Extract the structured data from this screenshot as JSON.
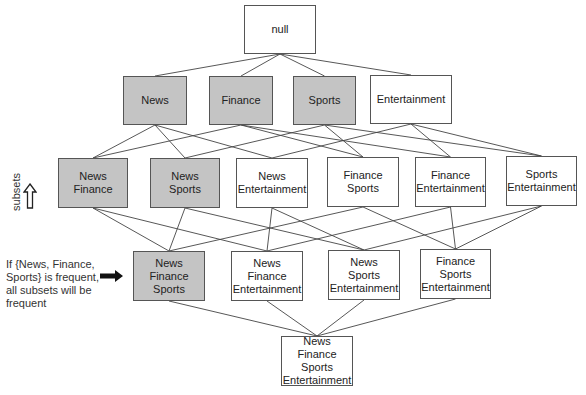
{
  "diagram": {
    "type": "itemset-lattice",
    "colors": {
      "frequent_fill": "#c4c4c4",
      "infrequent_fill": "#ffffff",
      "border": "#555555",
      "edge": "#444444"
    },
    "nodes": [
      {
        "id": "null",
        "lines": [
          "null"
        ],
        "frequent": false,
        "x": 244,
        "y": 5,
        "w": 72,
        "h": 49
      },
      {
        "id": "N",
        "lines": [
          "News"
        ],
        "frequent": true,
        "x": 123,
        "y": 76,
        "w": 64,
        "h": 49
      },
      {
        "id": "F",
        "lines": [
          "Finance"
        ],
        "frequent": true,
        "x": 209,
        "y": 76,
        "w": 64,
        "h": 49
      },
      {
        "id": "S",
        "lines": [
          "Sports"
        ],
        "frequent": true,
        "x": 293,
        "y": 76,
        "w": 63,
        "h": 49
      },
      {
        "id": "E",
        "lines": [
          "Entertainment"
        ],
        "frequent": false,
        "x": 370,
        "y": 75,
        "w": 82,
        "h": 49
      },
      {
        "id": "NF",
        "lines": [
          "News",
          "Finance"
        ],
        "frequent": true,
        "x": 58,
        "y": 158,
        "w": 70,
        "h": 50
      },
      {
        "id": "NS",
        "lines": [
          "News",
          "Sports"
        ],
        "frequent": true,
        "x": 150,
        "y": 158,
        "w": 70,
        "h": 50
      },
      {
        "id": "NE",
        "lines": [
          "News",
          "Entertainment"
        ],
        "frequent": false,
        "x": 236,
        "y": 158,
        "w": 72,
        "h": 50
      },
      {
        "id": "FS",
        "lines": [
          "Finance",
          "Sports"
        ],
        "frequent": false,
        "x": 327,
        "y": 157,
        "w": 72,
        "h": 50
      },
      {
        "id": "FE",
        "lines": [
          "Finance",
          "Entertainment"
        ],
        "frequent": false,
        "x": 415,
        "y": 157,
        "w": 71,
        "h": 50
      },
      {
        "id": "SE",
        "lines": [
          "Sports",
          "Entertainment"
        ],
        "frequent": false,
        "x": 506,
        "y": 156,
        "w": 71,
        "h": 50
      },
      {
        "id": "NFS",
        "lines": [
          "News",
          "Finance",
          "Sports"
        ],
        "frequent": true,
        "x": 133,
        "y": 251,
        "w": 72,
        "h": 50
      },
      {
        "id": "NFE",
        "lines": [
          "News",
          "Finance",
          "Entertainment"
        ],
        "frequent": false,
        "x": 231,
        "y": 251,
        "w": 72,
        "h": 50
      },
      {
        "id": "NSE",
        "lines": [
          "News",
          "Sports",
          "Entertainment"
        ],
        "frequent": false,
        "x": 328,
        "y": 250,
        "w": 72,
        "h": 50
      },
      {
        "id": "FSE",
        "lines": [
          "Finance",
          "Sports",
          "Entertainment"
        ],
        "frequent": false,
        "x": 420,
        "y": 249,
        "w": 71,
        "h": 50
      },
      {
        "id": "NFSE",
        "lines": [
          "News",
          "Finance",
          "Sports",
          "Entertainment"
        ],
        "frequent": false,
        "x": 281,
        "y": 336,
        "w": 72,
        "h": 50
      }
    ],
    "edges": [
      [
        "null",
        "N"
      ],
      [
        "null",
        "F"
      ],
      [
        "null",
        "S"
      ],
      [
        "null",
        "E"
      ],
      [
        "N",
        "NF"
      ],
      [
        "N",
        "NS"
      ],
      [
        "N",
        "NE"
      ],
      [
        "F",
        "NF"
      ],
      [
        "F",
        "FS"
      ],
      [
        "F",
        "FE"
      ],
      [
        "S",
        "NS"
      ],
      [
        "S",
        "FS"
      ],
      [
        "S",
        "SE"
      ],
      [
        "E",
        "NE"
      ],
      [
        "E",
        "FE"
      ],
      [
        "E",
        "SE"
      ],
      [
        "NF",
        "NFS"
      ],
      [
        "NF",
        "NFE"
      ],
      [
        "NS",
        "NFS"
      ],
      [
        "NS",
        "NSE"
      ],
      [
        "NE",
        "NFE"
      ],
      [
        "NE",
        "NSE"
      ],
      [
        "FS",
        "NFS"
      ],
      [
        "FS",
        "FSE"
      ],
      [
        "FE",
        "NFE"
      ],
      [
        "FE",
        "FSE"
      ],
      [
        "SE",
        "NSE"
      ],
      [
        "SE",
        "FSE"
      ],
      [
        "NFS",
        "NFSE"
      ],
      [
        "NFE",
        "NFSE"
      ],
      [
        "NSE",
        "NFSE"
      ],
      [
        "FSE",
        "NFSE"
      ]
    ]
  },
  "annotations": {
    "subsets_label": "subsets",
    "up_arrow_icon": "hollow-up-arrow",
    "note_lines": [
      "If {News, Finance,",
      "Sports} is frequent,",
      "all subsets will be",
      "frequent"
    ],
    "right_arrow_icon": "solid-right-arrow"
  }
}
